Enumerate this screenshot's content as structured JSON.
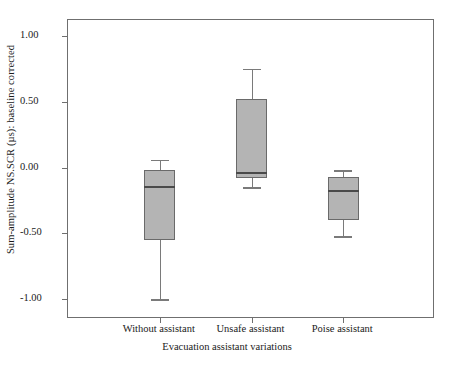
{
  "chart_data": {
    "type": "box",
    "title": "",
    "xlabel": "Evacuation assistant variations",
    "ylabel": "Sum-amplitude NS.SCR (µs): baseline corrected",
    "categories": [
      "Without assistant",
      "Unsafe assistant",
      "Poise assistant"
    ],
    "ylim": [
      -1.15,
      1.12
    ],
    "yticks": [
      1.0,
      0.5,
      0.0,
      -0.5,
      -1.0
    ],
    "ytick_labels": [
      "1.00",
      "0.50",
      "0.00",
      "-0.50",
      "-1.00"
    ],
    "grid": false,
    "legend": null,
    "boxes": [
      {
        "category": "Without assistant",
        "whisker_high": 0.06,
        "q3": -0.02,
        "median": -0.15,
        "q1": -0.55,
        "whisker_low": -1.0
      },
      {
        "category": "Unsafe assistant",
        "whisker_high": 0.75,
        "q3": 0.52,
        "median": -0.04,
        "q1": -0.08,
        "whisker_low": -0.15
      },
      {
        "category": "Poise assistant",
        "whisker_high": -0.02,
        "q3": -0.07,
        "median": -0.18,
        "q1": -0.4,
        "whisker_low": -0.52
      }
    ],
    "colors": {
      "box_fill": "#b4b4b4",
      "box_edge": "#6a6a6a",
      "median": "#4a4a4a",
      "whisker": "#7a7a7a",
      "frame": "#6f6f6f",
      "background": "#ffffff",
      "text": "#1a1a1a"
    }
  }
}
